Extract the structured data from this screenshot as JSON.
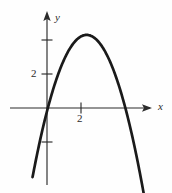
{
  "figure": {
    "background_color": "#fefefe",
    "ink_color": "#1a1a1a",
    "axis_color": "#2b2b2b"
  },
  "labels": {
    "y_axis": "y",
    "x_axis": "x",
    "y_tick_2": "2",
    "x_tick_2": "2"
  },
  "chart_data": {
    "type": "line",
    "title": "",
    "subtitle": "",
    "xlabel": "x",
    "ylabel": "y",
    "grid": false,
    "legend": false,
    "legend_position": "none",
    "axes": {
      "origin_px": [
        47,
        108
      ],
      "units_per_pixel": 0.0588,
      "pixels_per_unit": 17,
      "x_axis_drawn_range": [
        -2.2,
        6.2
      ],
      "y_axis_drawn_range": [
        -4.5,
        5.6
      ],
      "x_arrow": "right",
      "y_arrow": "up"
    },
    "xticks": [
      2
    ],
    "xtick_labels": [
      "2"
    ],
    "yticks": [
      -2,
      2,
      4
    ],
    "ytick_labels": [
      "",
      "2",
      ""
    ],
    "xlim": [
      -1.0,
      6.2
    ],
    "ylim": [
      -4.5,
      5.0
    ],
    "series": [
      {
        "name": "parabola",
        "equation": "y = -0.83(x - 0.05)(x - 4.6)",
        "vertex": [
          2.33,
          4.3
        ],
        "x_intercepts": [
          0.05,
          4.6
        ],
        "y_intercept": -0.19,
        "opens": "down",
        "x": [
          -0.85,
          -0.6,
          -0.35,
          -0.1,
          0.15,
          0.4,
          0.7,
          1.0,
          1.3,
          1.6,
          1.9,
          2.1,
          2.33,
          2.55,
          2.8,
          3.1,
          3.4,
          3.7,
          4.0,
          4.3,
          4.6,
          4.9,
          5.2,
          5.5,
          5.8
        ],
        "y": [
          -3.87,
          -2.78,
          -1.78,
          -0.87,
          -0.06,
          0.66,
          1.38,
          1.98,
          2.46,
          2.83,
          3.07,
          3.16,
          4.3,
          3.16,
          3.02,
          2.74,
          2.34,
          1.82,
          1.19,
          0.44,
          -0.42,
          -1.39,
          -2.47,
          -3.66,
          -4.96
        ]
      }
    ],
    "annotations": []
  }
}
